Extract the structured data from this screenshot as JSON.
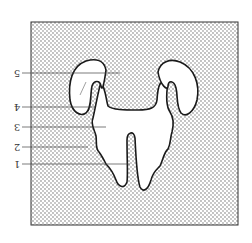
{
  "figure": {
    "colors": {
      "background": "#ffffff",
      "stipple": "#555555",
      "outline": "#1a1a1a",
      "frame": "#333333"
    },
    "labels": [
      {
        "id": "5",
        "text": "5",
        "y": 73,
        "x_end": 120
      },
      {
        "id": "4",
        "text": "4",
        "y": 107,
        "x_end": 95
      },
      {
        "id": "3",
        "text": "3",
        "y": 127,
        "x_end": 106
      },
      {
        "id": "2",
        "text": "2",
        "y": 147,
        "x_end": 88
      },
      {
        "id": "1",
        "text": "1",
        "y": 164,
        "x_end": 130
      }
    ]
  }
}
